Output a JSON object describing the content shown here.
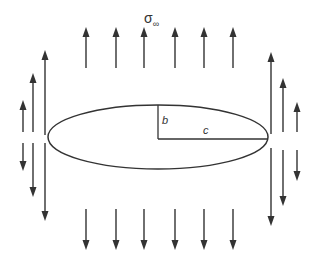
{
  "diagram": {
    "title_symbol": "σ",
    "title_subscript": "∞",
    "labels": {
      "semi_minor": "b",
      "semi_major": "c"
    },
    "ellipse": {
      "cx": 158,
      "cy": 137,
      "rx": 110,
      "ry": 32
    },
    "colors": {
      "stroke": "#333333",
      "background": "#ffffff"
    },
    "top_arrows_x": [
      86,
      116,
      144,
      175,
      204,
      233
    ],
    "bottom_arrows_x": [
      86,
      116,
      144,
      175,
      204,
      233
    ],
    "left_arrows": [
      {
        "x": 23,
        "up": [
          100,
          132
        ],
        "down": [
          143,
          171
        ]
      },
      {
        "x": 33,
        "up": [
          73,
          132
        ],
        "down": [
          143,
          197
        ]
      },
      {
        "x": 45,
        "up": [
          50,
          135
        ],
        "down": [
          143,
          221
        ]
      }
    ],
    "right_arrows": [
      {
        "x": 271,
        "up": [
          52,
          134
        ],
        "down": [
          148,
          226
        ]
      },
      {
        "x": 283,
        "up": [
          78,
          132
        ],
        "down": [
          150,
          206
        ]
      },
      {
        "x": 297,
        "up": [
          102,
          132
        ],
        "down": [
          150,
          181
        ]
      }
    ]
  }
}
